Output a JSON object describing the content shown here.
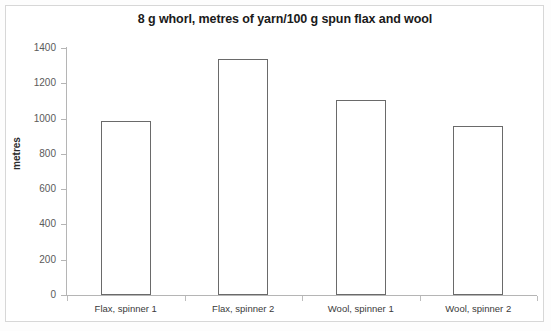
{
  "chart_data": {
    "type": "bar",
    "title": "8 g whorl, metres of yarn/100 g spun flax and wool",
    "xlabel": "",
    "ylabel": "metres",
    "categories": [
      "Flax, spinner 1",
      "Flax, spinner 2",
      "Wool, spinner 1",
      "Wool, spinner 2"
    ],
    "values": [
      985,
      1335,
      1105,
      960
    ],
    "ylim": [
      0,
      1400
    ],
    "ytick_step": 200,
    "yticks": [
      0,
      200,
      400,
      600,
      800,
      1000,
      1200,
      1400
    ],
    "ytick_labels": [
      "0",
      "200",
      "400",
      "600",
      "800",
      "1000",
      "1200",
      "1400"
    ],
    "grid": false,
    "legend": null,
    "bar_fill_color": "#ffffff",
    "bar_edge_color": "#6a6a6a",
    "axis_color": "#b5b5b5",
    "title_color": "#1a1a1a",
    "background_color": "#ffffff"
  }
}
